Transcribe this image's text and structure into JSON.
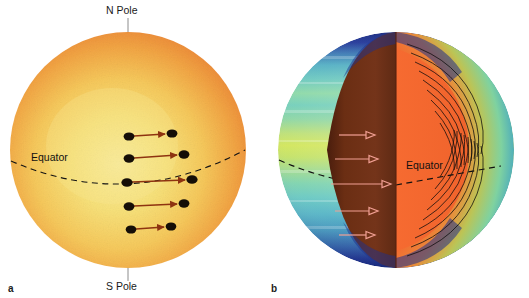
{
  "figure": {
    "background_color": "#ffffff",
    "width": 529,
    "height": 298
  },
  "panels": [
    {
      "id": "a",
      "label": "a",
      "caption_topic": "surface differential rotation of the Sun",
      "sphere": {
        "center_x": 128,
        "center_y": 150,
        "radius": 118,
        "limb_color": "#ef8f3c",
        "mid_color": "#f5b84e",
        "center_color": "#f7e585",
        "style": "photosphere granulation, limb darkening"
      },
      "annotations": {
        "north_pole_label": "N Pole",
        "south_pole_label": "S Pole",
        "equator_label": "Equator",
        "leader_line_color": "#8a8a8a",
        "equator_line_color": "#111111",
        "equator_line_style": "dashed"
      },
      "sunspot_tracks": {
        "description": "Pairs of sunspots with arrows showing angular displacement after one rotation; longest at the equator",
        "spot_color": "#120d08",
        "arrow_color": "#8e3310",
        "tracks": [
          {
            "latitude_label": "+40",
            "y": 136,
            "x_start": 128,
            "x_end": 170,
            "length": 42
          },
          {
            "latitude_label": "+20",
            "y": 158,
            "x_start": 128,
            "x_end": 182,
            "length": 54
          },
          {
            "latitude_label": "0",
            "y": 181,
            "x_start": 126,
            "x_end": 190,
            "length": 64
          },
          {
            "latitude_label": "-20",
            "y": 206,
            "x_start": 128,
            "x_end": 182,
            "length": 54
          },
          {
            "latitude_label": "-40",
            "y": 228,
            "x_start": 130,
            "x_end": 170,
            "length": 40
          }
        ]
      }
    },
    {
      "id": "b",
      "label": "b",
      "caption_topic": "interior rotation profile cutaway from helioseismology",
      "sphere": {
        "center_x": 131,
        "center_y": 150,
        "radius": 118,
        "surface_bands": [
          {
            "name": "polar-cap-north",
            "color": "#1d2f8c"
          },
          {
            "name": "high-latitude-north",
            "color": "#4fb4c4"
          },
          {
            "name": "mid-latitude-north",
            "color": "#7ed5b8"
          },
          {
            "name": "low-latitude-north",
            "color": "#b9e06a"
          },
          {
            "name": "equatorial",
            "color": "#cfe45e"
          },
          {
            "name": "low-latitude-south",
            "color": "#9fdc8e"
          },
          {
            "name": "mid-latitude-south",
            "color": "#66c9c2"
          },
          {
            "name": "high-latitude-south",
            "color": "#49a8c6"
          },
          {
            "name": "polar-cap-south",
            "color": "#1d2f8c"
          }
        ]
      },
      "cutaway": {
        "wedge_color": "#6e2f13",
        "interior_color": "#f4622c",
        "tachocline_color": "#2b3a8f",
        "contour_color": "#101010",
        "contour_description": "Nested closed contours of constant angular velocity in the convection zone, mirrored north and south"
      },
      "annotations": {
        "equator_label": "Equator",
        "equator_line_color": "#111111",
        "equator_line_style": "dashed"
      },
      "rotation_arrows": {
        "description": "Hollow outlined arrows on the cut face indicating rotation speed with latitude; longest at the equator",
        "arrow_outline_color": "#f09a8e",
        "arrows": [
          {
            "latitude_label": "+40",
            "y": 135,
            "x_start": 38,
            "length": 34
          },
          {
            "latitude_label": "+20",
            "y": 158,
            "x_start": 34,
            "length": 42
          },
          {
            "latitude_label": "0",
            "y": 183,
            "x_start": 30,
            "length": 52
          },
          {
            "latitude_label": "-20",
            "y": 210,
            "x_start": 34,
            "length": 42
          },
          {
            "latitude_label": "-40",
            "y": 234,
            "x_start": 38,
            "length": 34
          }
        ]
      }
    }
  ]
}
